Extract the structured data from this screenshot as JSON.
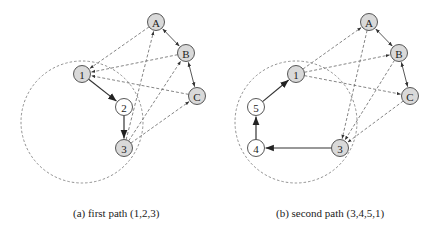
{
  "figure": {
    "panels": [
      {
        "id": "a",
        "caption": "(a) first path (1,2,3)",
        "nodes": [
          {
            "id": "A",
            "label": "A",
            "x": 156,
            "y": 22,
            "fill": "#d9d9d9"
          },
          {
            "id": "B",
            "label": "B",
            "x": 186,
            "y": 53,
            "fill": "#d9d9d9"
          },
          {
            "id": "C",
            "label": "C",
            "x": 197,
            "y": 96,
            "fill": "#d9d9d9"
          },
          {
            "id": "1",
            "label": "1",
            "x": 82,
            "y": 74,
            "fill": "#d9d9d9"
          },
          {
            "id": "2",
            "label": "2",
            "x": 124,
            "y": 107,
            "fill": "#ffffff"
          },
          {
            "id": "3",
            "label": "3",
            "x": 124,
            "y": 148,
            "fill": "#d9d9d9"
          }
        ],
        "solid_edges": [
          [
            "1",
            "2"
          ],
          [
            "2",
            "3"
          ]
        ],
        "bidirectional_edges": [
          [
            "A",
            "B"
          ],
          [
            "B",
            "C"
          ]
        ],
        "dashed_edges": [
          [
            "A",
            "1"
          ],
          [
            "B",
            "1"
          ],
          [
            "C",
            "1"
          ],
          [
            "3",
            "A"
          ],
          [
            "3",
            "B"
          ],
          [
            "3",
            "C"
          ]
        ],
        "dashed_circle": {
          "cx": 82,
          "cy": 122,
          "r": 61
        }
      },
      {
        "id": "b",
        "caption": "(b) second path (3,4,5,1)",
        "nodes": [
          {
            "id": "A",
            "label": "A",
            "x": 369,
            "y": 22,
            "fill": "#d9d9d9"
          },
          {
            "id": "B",
            "label": "B",
            "x": 399,
            "y": 53,
            "fill": "#d9d9d9"
          },
          {
            "id": "C",
            "label": "C",
            "x": 410,
            "y": 96,
            "fill": "#d9d9d9"
          },
          {
            "id": "1",
            "label": "1",
            "x": 296,
            "y": 74,
            "fill": "#d9d9d9"
          },
          {
            "id": "5",
            "label": "5",
            "x": 256,
            "y": 107,
            "fill": "#ffffff"
          },
          {
            "id": "4",
            "label": "4",
            "x": 256,
            "y": 148,
            "fill": "#ffffff"
          },
          {
            "id": "3",
            "label": "3",
            "x": 340,
            "y": 148,
            "fill": "#d9d9d9"
          }
        ],
        "solid_edges": [
          [
            "3",
            "4"
          ],
          [
            "4",
            "5"
          ],
          [
            "5",
            "1"
          ]
        ],
        "bidirectional_edges": [
          [
            "A",
            "B"
          ],
          [
            "B",
            "C"
          ]
        ],
        "dashed_edges": [
          [
            "1",
            "A"
          ],
          [
            "1",
            "B"
          ],
          [
            "1",
            "C"
          ],
          [
            "A",
            "3"
          ],
          [
            "B",
            "3"
          ],
          [
            "C",
            "3"
          ]
        ],
        "dashed_circle": {
          "cx": 296,
          "cy": 122,
          "r": 61
        }
      }
    ]
  }
}
